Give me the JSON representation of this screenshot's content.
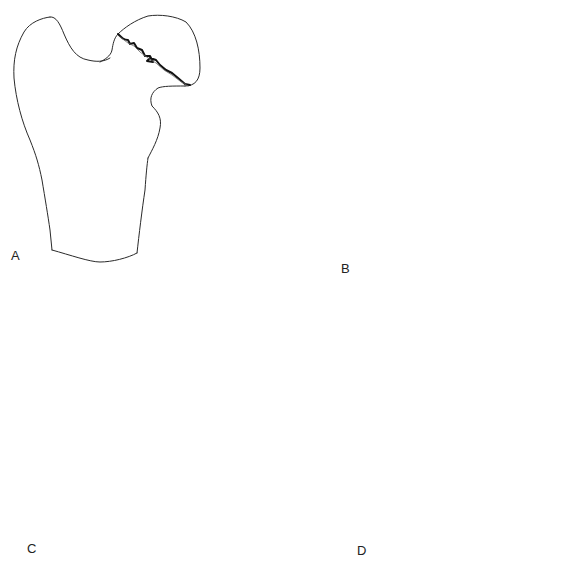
{
  "figure": {
    "colors": {
      "background": "#ffffff",
      "line": "#2a2a2a",
      "fracture": "#111111"
    },
    "panels": [
      {
        "id": "A",
        "label": "A",
        "label_pos": [
          11,
          256
        ],
        "fracture": "jagged line across femoral head"
      },
      {
        "id": "B",
        "label": "B",
        "label_pos": [
          341,
          268
        ],
        "fracture": "displaced fragment protruding from head"
      },
      {
        "id": "C",
        "label": "C",
        "label_pos": [
          27,
          548
        ],
        "fracture": "jagged line at head-neck junction"
      },
      {
        "id": "D",
        "label": "D",
        "label_pos": [
          357,
          550
        ],
        "fracture": "neck fracture with dashed comminution"
      }
    ]
  }
}
